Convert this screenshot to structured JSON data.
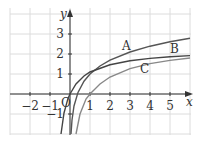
{
  "chart_data": {
    "type": "line",
    "title": "",
    "xlabel": "x",
    "ylabel": "y",
    "xlim": [
      -2.9,
      5.9
    ],
    "ylim": [
      -1.9,
      3.6
    ],
    "grid": true,
    "x_ticks": [
      "-2",
      "-1",
      "1",
      "2",
      "3",
      "4",
      "5"
    ],
    "y_ticks": [
      "-1",
      "1",
      "2",
      "3"
    ],
    "origin_label": "O",
    "series": [
      {
        "name": "A",
        "x": [
          0.05,
          0.1,
          0.2,
          0.4,
          0.7,
          1,
          1.5,
          2,
          3,
          4,
          5,
          6
        ],
        "y": [
          -2.0,
          -1.3,
          -0.6,
          0.08,
          0.64,
          1.0,
          1.4,
          1.69,
          2.1,
          2.39,
          2.61,
          2.79
        ]
      },
      {
        "name": "B",
        "x": [
          -0.45,
          -0.3,
          -0.1,
          0,
          0.3,
          0.7,
          1,
          2,
          3,
          4,
          5,
          6
        ],
        "y": [
          -2.0,
          -0.95,
          -0.22,
          0,
          0.5,
          0.9,
          1.1,
          1.46,
          1.66,
          1.78,
          1.86,
          1.92
        ]
      },
      {
        "name": "C",
        "x": [
          0.3,
          0.5,
          0.8,
          1,
          1.5,
          2,
          3,
          4,
          5,
          6
        ],
        "y": [
          -2.0,
          -1.0,
          -0.25,
          0,
          0.5,
          0.85,
          1.27,
          1.52,
          1.68,
          1.8
        ]
      }
    ],
    "labels": [
      {
        "text": "A",
        "x": 2.6,
        "y": 2.2
      },
      {
        "text": "B",
        "x": 5.0,
        "y": 2.05
      },
      {
        "text": "C",
        "x": 3.5,
        "y": 1.05
      }
    ]
  }
}
